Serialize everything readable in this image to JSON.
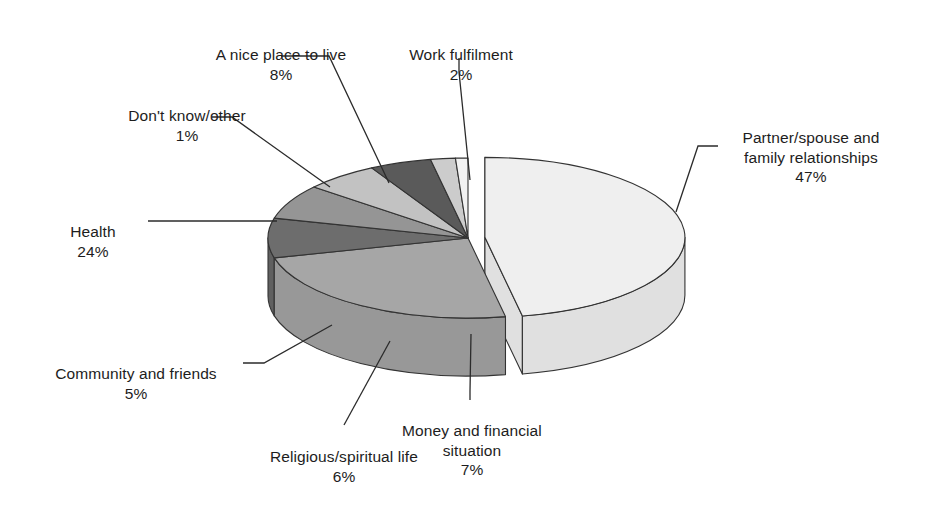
{
  "chart_data": {
    "type": "pie",
    "title": "",
    "subtitle": "",
    "xlabel": "",
    "ylabel": "",
    "legend_position": "none",
    "grid": false,
    "style": "3d-exploded-pie",
    "units": "%",
    "total": 100,
    "categories": [
      "Partner/spouse and family relationships",
      "Health",
      "A nice place to live",
      "Money and financial situation",
      "Religious/spiritual life",
      "Community and friends",
      "Work fulfilment",
      "Don't know/other"
    ],
    "values": [
      47,
      24,
      8,
      7,
      6,
      5,
      2,
      1
    ],
    "slices": [
      {
        "label": "Partner/spouse and family relationships",
        "value": 47,
        "pct_text": "47%",
        "color": "#efefef",
        "side_color": "#e0e0e0",
        "exploded": true
      },
      {
        "label": "Health",
        "value": 24,
        "pct_text": "24%",
        "color": "#a6a6a6",
        "side_color": "#989898",
        "exploded": false
      },
      {
        "label": "A nice place to live",
        "value": 8,
        "pct_text": "8%",
        "color": "#6d6d6d",
        "side_color": "#606060",
        "exploded": false
      },
      {
        "label": "Money and financial situation",
        "value": 7,
        "pct_text": "7%",
        "color": "#959595",
        "side_color": "#888888",
        "exploded": false
      },
      {
        "label": "Religious/spiritual life",
        "value": 6,
        "pct_text": "6%",
        "color": "#c2c2c2",
        "side_color": "#b5b5b5",
        "exploded": false
      },
      {
        "label": "Community and friends",
        "value": 5,
        "pct_text": "5%",
        "color": "#5a5a5a",
        "side_color": "#4e4e4e",
        "exploded": false
      },
      {
        "label": "Work fulfilment",
        "value": 2,
        "pct_text": "2%",
        "color": "#cccccc",
        "side_color": "#bfbfbf",
        "exploded": false
      },
      {
        "label": "Don't know/other",
        "value": 1,
        "pct_text": "1%",
        "color": "#f2f2f2",
        "side_color": "#e6e6e6",
        "exploded": false
      }
    ]
  },
  "labels": {
    "partner": {
      "text": "Partner/spouse and\nfamily relationships",
      "pct": "47%"
    },
    "health": {
      "text": "Health",
      "pct": "24%"
    },
    "nice_place": {
      "text": "A nice place to live",
      "pct": "8%"
    },
    "money": {
      "text": "Money and financial\nsituation",
      "pct": "7%"
    },
    "religious": {
      "text": "Religious/spiritual life",
      "pct": "6%"
    },
    "community": {
      "text": "Community and friends",
      "pct": "5%"
    },
    "work": {
      "text": "Work fulfilment",
      "pct": "2%"
    },
    "dontknow": {
      "text": "Don't know/other",
      "pct": "1%"
    }
  },
  "colors": {
    "outline": "#333333",
    "leader_line": "#2b2b2b",
    "background": "#ffffff",
    "text": "#1d1d1d"
  }
}
